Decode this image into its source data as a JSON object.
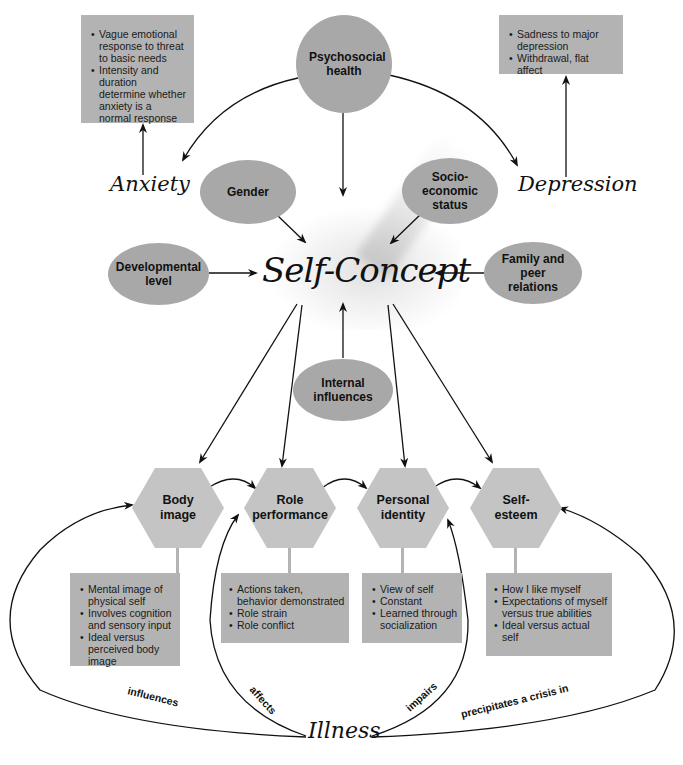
{
  "center": {
    "label": "Self-Concept"
  },
  "top": {
    "psychosocial": "Psychosocial health",
    "anxiety": {
      "label": "Anxiety",
      "notes": [
        "Vague emotional response to threat to basic needs",
        "Intensity and duration determine whether anxiety is a normal response"
      ]
    },
    "depression": {
      "label": "Depression",
      "notes": [
        "Sadness to major depression",
        "Withdrawal, flat affect"
      ]
    }
  },
  "influences": {
    "gender": "Gender",
    "socioeconomic": "Socio-economic status",
    "developmental": "Developmental level",
    "family": "Family and peer relations",
    "internal": "Internal influences"
  },
  "components": [
    {
      "label": "Body image",
      "notes": [
        "Mental image of physical self",
        "Involves cognition and sensory input",
        "Ideal versus perceived body image"
      ]
    },
    {
      "label": "Role performance",
      "notes": [
        "Actions taken, behavior demonstrated",
        "Role strain",
        "Role conflict"
      ]
    },
    {
      "label": "Personal identity",
      "notes": [
        "View of self",
        "Constant",
        "Learned through socialization"
      ]
    },
    {
      "label": "Self-esteem",
      "notes": [
        "How I like myself",
        "Expectations of myself versus true abilities",
        "Ideal versus actual self"
      ]
    }
  ],
  "illness": {
    "label": "Illness",
    "edges": [
      "influences",
      "affects",
      "impairs",
      "precipitates a crisis in"
    ]
  },
  "colors": {
    "oval": "#a8a8a8",
    "hexagon": "#c4c4c4",
    "note_box": "#b3b3b3",
    "line": "#111111"
  }
}
